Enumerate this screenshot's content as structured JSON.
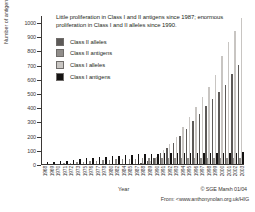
{
  "top_cut_text": "",
  "chart_title": "Little proliferation in Class I and II antigens since 1987; enormous proliferation in Class I and II alleles since 1990.",
  "axes": {
    "ylabel": "Number of antigens/alleles",
    "xlabel": "Year",
    "yticks": [
      0,
      100,
      200,
      300,
      400,
      500,
      600,
      700,
      800,
      900,
      1000
    ]
  },
  "legend": {
    "items": [
      {
        "label": "Class II alleles",
        "color": "#5d5a58"
      },
      {
        "label": "Class II antigens",
        "color": "#908d8a"
      },
      {
        "label": "Class I alleles",
        "color": "#c8c5c2"
      },
      {
        "label": "Class I antigens",
        "color": "#141212"
      }
    ]
  },
  "credits": {
    "line1": "© SGE Marsh 01/04",
    "line2": "From: <www.anthonynolan.org.uk/HIG"
  },
  "chart_data": {
    "type": "bar",
    "title": "Little proliferation in Class I and II antigens since 1987; enormous proliferation in Class I and II alleles since 1990.",
    "xlabel": "Year",
    "ylabel": "Number of antigens/alleles",
    "ylim": [
      0,
      1050
    ],
    "grid": false,
    "legend_position": "upper-left",
    "categories": [
      "1968",
      "1969",
      "1970",
      "1971",
      "1972",
      "1973",
      "1975",
      "1976",
      "1977",
      "1978",
      "1980",
      "1982",
      "1984",
      "1985",
      "1987",
      "1988",
      "1989",
      "1990",
      "1991",
      "1992",
      "1993",
      "1994",
      "1995",
      "1996",
      "1997",
      "1998",
      "1999",
      "2000",
      "2001",
      "2002",
      "2003"
    ],
    "series": [
      {
        "name": "Class I antigens",
        "color": "#141212",
        "values": [
          13,
          15,
          20,
          24,
          27,
          32,
          39,
          43,
          48,
          52,
          56,
          60,
          63,
          66,
          70,
          72,
          73,
          74,
          75,
          76,
          77,
          77,
          78,
          78,
          79,
          79,
          80,
          80,
          81,
          81,
          82
        ]
      },
      {
        "name": "Class I alleles",
        "color": "#c8c5c2",
        "values": [
          0,
          0,
          0,
          0,
          0,
          0,
          0,
          0,
          0,
          0,
          0,
          0,
          0,
          0,
          0,
          8,
          22,
          48,
          100,
          140,
          190,
          260,
          330,
          400,
          470,
          545,
          630,
          760,
          860,
          940,
          1030
        ]
      },
      {
        "name": "Class II antigens",
        "color": "#908d8a",
        "values": [
          0,
          0,
          0,
          4,
          8,
          12,
          17,
          21,
          24,
          27,
          30,
          33,
          35,
          36,
          38,
          39,
          40,
          40,
          41,
          41,
          42,
          42,
          42,
          43,
          43,
          43,
          44,
          44,
          44,
          45,
          45
        ]
      },
      {
        "name": "Class II alleles",
        "color": "#5d5a58",
        "values": [
          0,
          0,
          0,
          0,
          0,
          0,
          0,
          0,
          0,
          0,
          0,
          0,
          0,
          0,
          0,
          6,
          18,
          40,
          75,
          110,
          150,
          200,
          250,
          300,
          355,
          410,
          460,
          505,
          555,
          635,
          695
        ]
      }
    ]
  }
}
